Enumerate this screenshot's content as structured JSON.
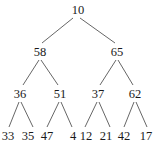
{
  "tree": {
    "nodes": [
      {
        "id": "n0",
        "value": "10",
        "x": 78,
        "y": 14
      },
      {
        "id": "n1",
        "value": "58",
        "x": 40,
        "y": 56
      },
      {
        "id": "n2",
        "value": "65",
        "x": 117,
        "y": 56
      },
      {
        "id": "n3",
        "value": "36",
        "x": 20,
        "y": 98
      },
      {
        "id": "n4",
        "value": "51",
        "x": 60,
        "y": 98
      },
      {
        "id": "n5",
        "value": "37",
        "x": 98,
        "y": 98
      },
      {
        "id": "n6",
        "value": "62",
        "x": 135,
        "y": 98
      },
      {
        "id": "n7",
        "value": "33",
        "x": 8,
        "y": 140
      },
      {
        "id": "n8",
        "value": "35",
        "x": 28,
        "y": 140
      },
      {
        "id": "n9",
        "value": "47",
        "x": 47,
        "y": 140
      },
      {
        "id": "n10",
        "value": "4",
        "x": 73,
        "y": 140
      },
      {
        "id": "n11",
        "value": "12",
        "x": 86,
        "y": 140
      },
      {
        "id": "n12",
        "value": "21",
        "x": 106,
        "y": 140
      },
      {
        "id": "n13",
        "value": "42",
        "x": 124,
        "y": 140
      },
      {
        "id": "n14",
        "value": "17",
        "x": 146,
        "y": 140
      }
    ],
    "edges": [
      {
        "from": "n0",
        "to": "n1",
        "x1": 73,
        "y1": 18,
        "x2": 42,
        "y2": 43
      },
      {
        "from": "n0",
        "to": "n2",
        "x1": 80,
        "y1": 18,
        "x2": 115,
        "y2": 43
      },
      {
        "from": "n1",
        "to": "n3",
        "x1": 39,
        "y1": 60,
        "x2": 23,
        "y2": 85
      },
      {
        "from": "n1",
        "to": "n4",
        "x1": 41,
        "y1": 60,
        "x2": 58,
        "y2": 85
      },
      {
        "from": "n2",
        "to": "n5",
        "x1": 116,
        "y1": 60,
        "x2": 100,
        "y2": 85
      },
      {
        "from": "n2",
        "to": "n6",
        "x1": 118,
        "y1": 60,
        "x2": 133,
        "y2": 85
      },
      {
        "from": "n3",
        "to": "n7",
        "x1": 19,
        "y1": 102,
        "x2": 9,
        "y2": 127
      },
      {
        "from": "n3",
        "to": "n8",
        "x1": 21,
        "y1": 102,
        "x2": 33,
        "y2": 127
      },
      {
        "from": "n4",
        "to": "n9",
        "x1": 59,
        "y1": 102,
        "x2": 47,
        "y2": 127
      },
      {
        "from": "n4",
        "to": "n10",
        "x1": 61,
        "y1": 102,
        "x2": 72,
        "y2": 127
      },
      {
        "from": "n5",
        "to": "n11",
        "x1": 97,
        "y1": 102,
        "x2": 85,
        "y2": 127
      },
      {
        "from": "n5",
        "to": "n12",
        "x1": 99,
        "y1": 102,
        "x2": 110,
        "y2": 127
      },
      {
        "from": "n6",
        "to": "n13",
        "x1": 134,
        "y1": 102,
        "x2": 124,
        "y2": 127
      },
      {
        "from": "n6",
        "to": "n14",
        "x1": 136,
        "y1": 102,
        "x2": 147,
        "y2": 127
      }
    ]
  }
}
